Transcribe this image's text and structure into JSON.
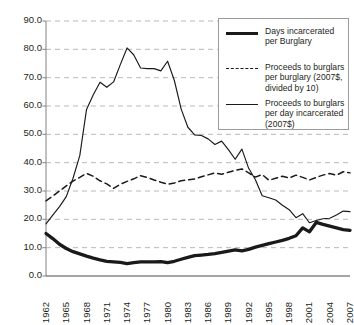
{
  "chart_data": {
    "type": "line",
    "title": "",
    "xlabel": "",
    "ylabel": "",
    "xlim": [
      1962,
      2007
    ],
    "ylim": [
      0.0,
      90.0
    ],
    "ytick_labels": [
      "90.0",
      "80.0",
      "70.0",
      "60.0",
      "50.0",
      "40.0",
      "30.0",
      "20.0",
      "10.0",
      "0.0"
    ],
    "ytick_values": [
      90.0,
      80.0,
      70.0,
      60.0,
      50.0,
      40.0,
      30.0,
      20.0,
      10.0,
      0.0
    ],
    "xtick_labels": [
      "1962",
      "1965",
      "1968",
      "1971",
      "1974",
      "1977",
      "1980",
      "1983",
      "1986",
      "1989",
      "1992",
      "1995",
      "1998",
      "2001",
      "2004",
      "2007"
    ],
    "xtick_values": [
      1962,
      1965,
      1968,
      1971,
      1974,
      1977,
      1980,
      1983,
      1986,
      1989,
      1992,
      1995,
      1998,
      2001,
      2004,
      2007
    ],
    "grid": true,
    "grid_axis": "y",
    "grid_style": "dashed",
    "legend_position": "top-right",
    "x": [
      1962,
      1963,
      1964,
      1965,
      1966,
      1967,
      1968,
      1969,
      1970,
      1971,
      1972,
      1973,
      1974,
      1975,
      1976,
      1977,
      1978,
      1979,
      1980,
      1981,
      1982,
      1983,
      1984,
      1985,
      1986,
      1987,
      1988,
      1989,
      1990,
      1991,
      1992,
      1993,
      1994,
      1995,
      1996,
      1997,
      1998,
      1999,
      2000,
      2001,
      2002,
      2003,
      2004,
      2005,
      2006,
      2007
    ],
    "series": [
      {
        "name": "Days incarcerated per Burglary",
        "style": "thick-solid",
        "color": "#1a1a1a",
        "values": [
          15.0,
          13.2,
          11.2,
          9.7,
          8.6,
          7.8,
          7.0,
          6.3,
          5.7,
          5.2,
          5.0,
          4.8,
          4.4,
          4.7,
          5.0,
          5.0,
          5.0,
          5.1,
          4.7,
          5.2,
          5.9,
          6.6,
          7.2,
          7.4,
          7.6,
          7.9,
          8.3,
          8.8,
          9.2,
          8.9,
          9.4,
          10.2,
          10.8,
          11.4,
          12.0,
          12.6,
          13.3,
          14.2,
          17.0,
          15.6,
          18.9,
          18.2,
          17.6,
          17.0,
          16.4,
          16.1
        ]
      },
      {
        "name": "Proceeds to burglars per burglary (2007$, divided by 10)",
        "style": "dashed",
        "color": "#1a1a1a",
        "values": [
          26.5,
          28.2,
          30.0,
          31.8,
          33.5,
          34.8,
          36.2,
          35.2,
          33.6,
          32.5,
          30.9,
          32.4,
          33.4,
          34.3,
          35.4,
          34.8,
          33.9,
          33.1,
          32.4,
          32.8,
          33.6,
          33.9,
          34.2,
          35.0,
          35.7,
          36.4,
          35.9,
          36.6,
          37.3,
          37.8,
          36.4,
          34.9,
          35.8,
          33.8,
          34.5,
          35.2,
          34.6,
          35.6,
          34.8,
          33.9,
          34.8,
          35.6,
          36.2,
          35.6,
          36.8,
          36.4
        ]
      },
      {
        "name": "Proceeds to burglars per day incarcerated (2007$)",
        "style": "thin-solid",
        "color": "#1a1a1a",
        "values": [
          18.4,
          21.5,
          24.5,
          28.0,
          34.5,
          42.5,
          58.8,
          64.0,
          68.4,
          66.6,
          68.5,
          74.6,
          80.5,
          78.0,
          73.4,
          73.2,
          73.2,
          72.4,
          75.8,
          69.0,
          59.0,
          52.5,
          49.8,
          49.6,
          48.4,
          46.4,
          47.6,
          44.6,
          41.2,
          44.8,
          38.0,
          34.0,
          28.3,
          27.6,
          26.8,
          25.0,
          23.4,
          20.6,
          22.0,
          18.8,
          19.6,
          20.2,
          20.4,
          21.5,
          22.9,
          22.7
        ]
      }
    ],
    "legend": [
      {
        "key": "thick-solid",
        "lines": [
          "Days incarcerated",
          "per Burglary"
        ]
      },
      {
        "key": "dashed",
        "lines": [
          "Proceeds to burglars",
          "per burglary (2007$,",
          "divided by 10)"
        ]
      },
      {
        "key": "thin-solid",
        "lines": [
          "Proceeds to burglars",
          "per day incarcerated",
          "(2007$)"
        ]
      }
    ]
  }
}
